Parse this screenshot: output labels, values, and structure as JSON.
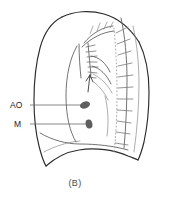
{
  "figure": {
    "caption": "(B)",
    "type": "lateral-chest-radiograph-line-drawing",
    "background_color": "#ffffff"
  },
  "labels": [
    {
      "id": "ao",
      "text": "AO",
      "x": 10,
      "y": 108,
      "leader_from_x": 30,
      "leader_to_x": 84,
      "leader_y": 105
    },
    {
      "id": "m",
      "text": "M",
      "x": 14,
      "y": 127,
      "leader_from_x": 30,
      "leader_to_x": 87,
      "leader_y": 124
    }
  ],
  "markers": [
    {
      "id": "ao-marker",
      "name": "aorta-marker",
      "cx": 85,
      "cy": 105,
      "rx": 5.2,
      "ry": 3.4,
      "rotate": -20,
      "color": "#5e5e5e"
    },
    {
      "id": "m-marker",
      "name": "mass-marker",
      "cx": 89,
      "cy": 124,
      "rx": 3.4,
      "ry": 4.6,
      "rotate": -10,
      "color": "#5e5e5e"
    }
  ],
  "colors": {
    "outline": "#2b2b2b",
    "inner": "#5a5a5a",
    "faint": "#8a8a8a",
    "spine_dots": "#b0b0b0",
    "marker": "#5e5e5e",
    "label_text": "#1a1a1a",
    "caption_text": "#4a4a4a"
  },
  "anatomy": {
    "chest_outline_name": "chest-wall-outline",
    "diaphragm_name": "diaphragm-curve",
    "spine_name": "vertebral-column-dotted-line",
    "ribs_name": "rib-tick-marks",
    "trachea_name": "trachea-line",
    "hilum_name": "hilar-vessels",
    "arrow_name": "pointer-arrow",
    "rib_count": 11,
    "vertebral_tick_count": 9
  }
}
